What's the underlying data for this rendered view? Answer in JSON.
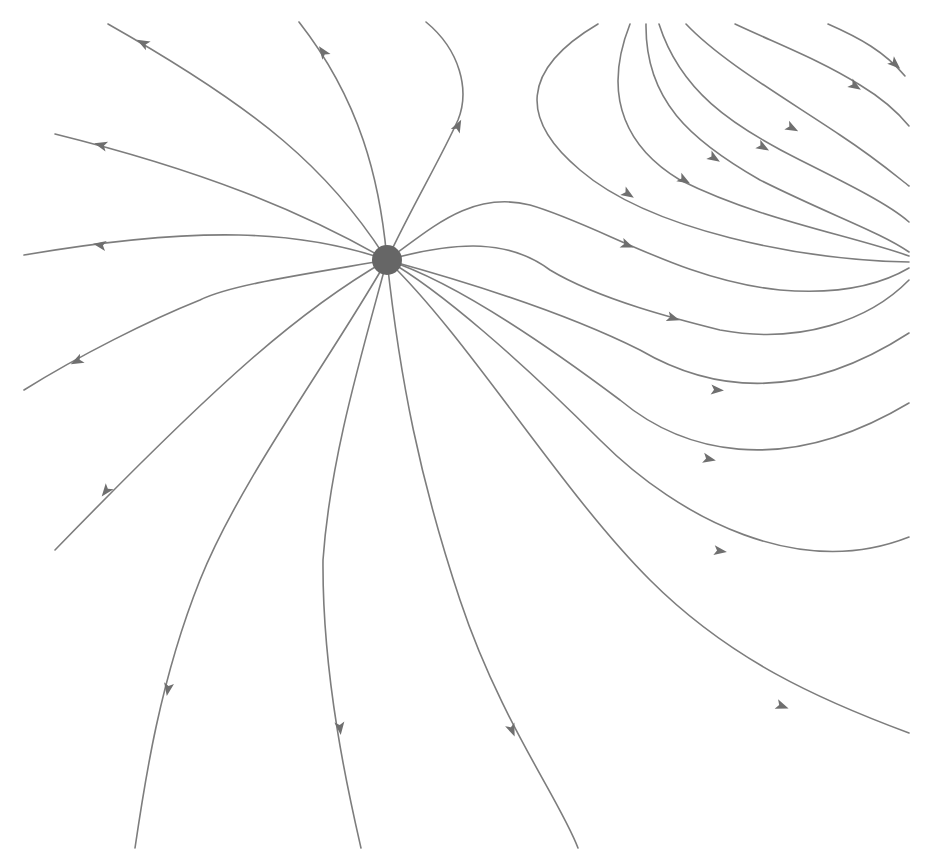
{
  "diagram": {
    "type": "phase-portrait",
    "width": 929,
    "height": 868,
    "colors": {
      "background": "#ffffff",
      "stroke": "#7d7d7d",
      "arrow": "#6f6f6f",
      "node": "#666666"
    },
    "node": {
      "kind": "source",
      "cx": 387,
      "cy": 260,
      "r": 15
    },
    "streamlines": [
      {
        "id": "nw-1",
        "d": "M387,260 C330,170 260,110 108,24",
        "arrow": {
          "x": 143,
          "y": 43,
          "angle": 208
        }
      },
      {
        "id": "n-1",
        "d": "M387,260 C380,180 360,100 299,22",
        "arrow": {
          "x": 323,
          "y": 52,
          "angle": 235
        }
      },
      {
        "id": "n-2",
        "d": "M387,260 C410,210 440,160 458,120 C470,90 460,50 426,22",
        "arrow": {
          "x": 458,
          "y": 126,
          "angle": 297
        }
      },
      {
        "id": "w-1",
        "d": "M387,260 C300,210 200,170 55,134",
        "arrow": {
          "x": 101,
          "y": 145,
          "angle": 195
        }
      },
      {
        "id": "w-2",
        "d": "M387,260 C300,230 200,225 24,255",
        "arrow": {
          "x": 100,
          "y": 245,
          "angle": 190
        }
      },
      {
        "id": "sw-1",
        "d": "M387,260 C300,275 230,285 200,300 C150,320 80,355 24,390",
        "arrow": {
          "x": 77,
          "y": 361,
          "angle": 153
        }
      },
      {
        "id": "sw-2",
        "d": "M387,260 C300,310 220,380 55,550",
        "arrow": {
          "x": 106,
          "y": 491,
          "angle": 128
        }
      },
      {
        "id": "s-1",
        "d": "M387,260 C330,360 240,480 200,580 C160,680 145,780 135,848",
        "arrow": {
          "x": 168,
          "y": 689,
          "angle": 100
        }
      },
      {
        "id": "s-2",
        "d": "M387,260 C360,360 330,460 323,560 C322,680 350,800 361,848",
        "arrow": {
          "x": 340,
          "y": 728,
          "angle": 84
        }
      },
      {
        "id": "s-3",
        "d": "M387,260 C400,380 420,480 460,600 C500,720 560,800 578,848",
        "arrow": {
          "x": 512,
          "y": 730,
          "angle": 68
        }
      },
      {
        "id": "se-1",
        "d": "M387,260 C470,340 560,490 650,580 C730,660 820,700 909,733",
        "arrow": {
          "x": 782,
          "y": 706,
          "angle": 20
        }
      },
      {
        "id": "e-1",
        "d": "M387,260 C440,290 520,360 600,440 C680,520 800,580 909,537",
        "arrow": {
          "x": 720,
          "y": 551,
          "angle": 8
        }
      },
      {
        "id": "e-2",
        "d": "M387,260 C450,280 540,340 620,400 C680,450 780,480 909,403",
        "arrow": {
          "x": 709,
          "y": 459,
          "angle": 12
        }
      },
      {
        "id": "e-3",
        "d": "M387,260 C460,280 560,310 640,350 C700,385 790,410 909,333",
        "arrow": {
          "x": 717,
          "y": 390,
          "angle": 5
        }
      },
      {
        "id": "e-4",
        "d": "M387,260 C460,240 510,240 550,270 C600,300 680,320 720,330 C800,345 870,320 909,280",
        "arrow": {
          "x": 673,
          "y": 318,
          "angle": 18
        }
      },
      {
        "id": "e-5",
        "d": "M387,260 C430,230 470,190 530,205 C600,225 680,280 780,290 C840,295 880,285 909,268",
        "arrow": {
          "x": 627,
          "y": 245,
          "angle": 22
        }
      },
      {
        "id": "ne-1",
        "d": "M598,24 C520,70 520,120 580,170 C650,230 800,260 909,262",
        "arrow": {
          "x": 628,
          "y": 194,
          "angle": 33
        }
      },
      {
        "id": "ne-2",
        "d": "M630,24 C600,100 630,150 680,180 C760,220 850,235 909,256",
        "arrow": {
          "x": 684,
          "y": 180,
          "angle": 30
        }
      },
      {
        "id": "ne-3",
        "d": "M646,24 C645,100 690,140 760,180 C830,215 880,232 909,252",
        "arrow": {
          "x": 714,
          "y": 158,
          "angle": 32
        }
      },
      {
        "id": "ne-4",
        "d": "M659,24 C680,90 730,125 800,160 C850,185 890,205 909,222",
        "arrow": {
          "x": 763,
          "y": 147,
          "angle": 30
        }
      },
      {
        "id": "ne-5",
        "d": "M686,24 C720,60 780,95 840,135 C875,158 895,175 909,186",
        "arrow": {
          "x": 792,
          "y": 128,
          "angle": 28
        }
      },
      {
        "id": "ne-6",
        "d": "M735,24 C780,45 820,60 860,85 C885,100 900,115 909,126",
        "arrow": {
          "x": 855,
          "y": 86,
          "angle": 32
        }
      },
      {
        "id": "ne-7",
        "d": "M828,24 C860,38 885,52 905,76",
        "arrow": {
          "x": 895,
          "y": 64,
          "angle": 42
        }
      }
    ]
  }
}
